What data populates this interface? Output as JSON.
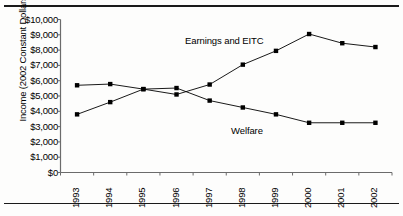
{
  "chart_data": {
    "type": "line",
    "title": "",
    "xlabel": "",
    "ylabel": "Income (2002 Constant Dollars)",
    "categories": [
      "1993",
      "1994",
      "1995",
      "1996",
      "1997",
      "1998",
      "1999",
      "2000",
      "2001",
      "2002"
    ],
    "ylim": [
      0,
      10000
    ],
    "ytick_labels": [
      "$10,000",
      "$9,000",
      "$8,000",
      "$7,000",
      "$6,000",
      "$5,000",
      "$4,000",
      "$3,000",
      "$2,000",
      "$1,000",
      "$0"
    ],
    "ytick_values": [
      10000,
      9000,
      8000,
      7000,
      6000,
      5000,
      4000,
      3000,
      2000,
      1000,
      0
    ],
    "grid": false,
    "legend": "none",
    "series": [
      {
        "name": "Earnings and EITC",
        "values": [
          3800,
          4600,
          5450,
          5100,
          5750,
          7050,
          7950,
          9050,
          8450,
          8200
        ],
        "color": "#000000",
        "marker": "square",
        "label_x": 185,
        "label_y": 35
      },
      {
        "name": "Welfare",
        "values": [
          5700,
          5780,
          5450,
          5520,
          4700,
          4250,
          3800,
          3250,
          3250,
          3250
        ],
        "color": "#000000",
        "marker": "square",
        "label_x": 231,
        "label_y": 125
      }
    ],
    "annotations": [
      "Earnings and EITC",
      "Welfare"
    ]
  }
}
